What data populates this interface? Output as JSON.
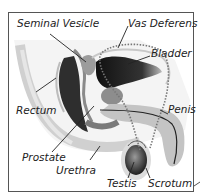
{
  "diagram": {
    "title": "",
    "labels": {
      "seminal_vesicle": "Seminal Vesicle",
      "vas_deferens": "Vas Deferens",
      "bladder": "Bladder",
      "rectum": "Rectum",
      "penis": "Penis",
      "prostate": "Prostate",
      "urethra": "Urethra",
      "testis": "Testis",
      "scrotum": "Scrotum"
    },
    "colors": {
      "frame": "#555555",
      "tissue_light": "#d9d9d9",
      "tissue_mid": "#a6a6a6",
      "tissue_dark": "#2b2b2b",
      "leader_line": "#222222"
    }
  }
}
